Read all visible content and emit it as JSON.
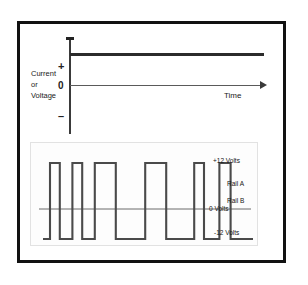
{
  "diagram": {
    "upper_plot": {
      "y_axis_label": [
        "Current",
        "or",
        "Voltage"
      ],
      "ticks": {
        "positive": "+",
        "zero": "0",
        "negative": "–"
      },
      "x_axis_label": "Time",
      "signal_description": "steady positive DC level"
    },
    "lower_plot": {
      "labels": {
        "plus12": "+12 Volts",
        "rail_a": "Rail A",
        "rail_b": "Rail B",
        "zero": "0 Volts",
        "minus12": "-12 Volts"
      }
    }
  },
  "chart_data": [
    {
      "type": "line",
      "title": "",
      "xlabel": "Time",
      "ylabel": "Current or Voltage",
      "ytick_labels": [
        "+",
        "0",
        "-"
      ],
      "ylim": [
        -1,
        1
      ],
      "grid": false,
      "legend": "none",
      "series": [
        {
          "name": "DC level",
          "x": [
            0,
            100
          ],
          "values": [
            0.62,
            0.62
          ]
        },
        {
          "name": "zero axis",
          "x": [
            0,
            100
          ],
          "values": [
            0,
            0
          ]
        }
      ]
    },
    {
      "type": "line",
      "title": "",
      "xlabel": "",
      "ylabel": "Volts",
      "ylim": [
        -12,
        12
      ],
      "ytick_values": [
        12,
        0,
        -12
      ],
      "ytick_labels": [
        "+12 Volts",
        "0 Volts",
        "-12 Volts"
      ],
      "annotations": [
        "Rail A",
        "Rail B"
      ],
      "grid": false,
      "legend": "none",
      "series": [
        {
          "name": "PWM square wave",
          "waveform": "square",
          "high": 12,
          "low": -12,
          "pulses": [
            {
              "rise": 5,
              "fall": 12
            },
            {
              "rise": 21,
              "fall": 28
            },
            {
              "rise": 37,
              "fall": 52
            },
            {
              "rise": 73,
              "fall": 88
            },
            {
              "rise": 108,
              "fall": 115
            },
            {
              "rise": 126,
              "fall": 134
            }
          ],
          "x_start": 0,
          "x_end": 150
        }
      ]
    }
  ]
}
